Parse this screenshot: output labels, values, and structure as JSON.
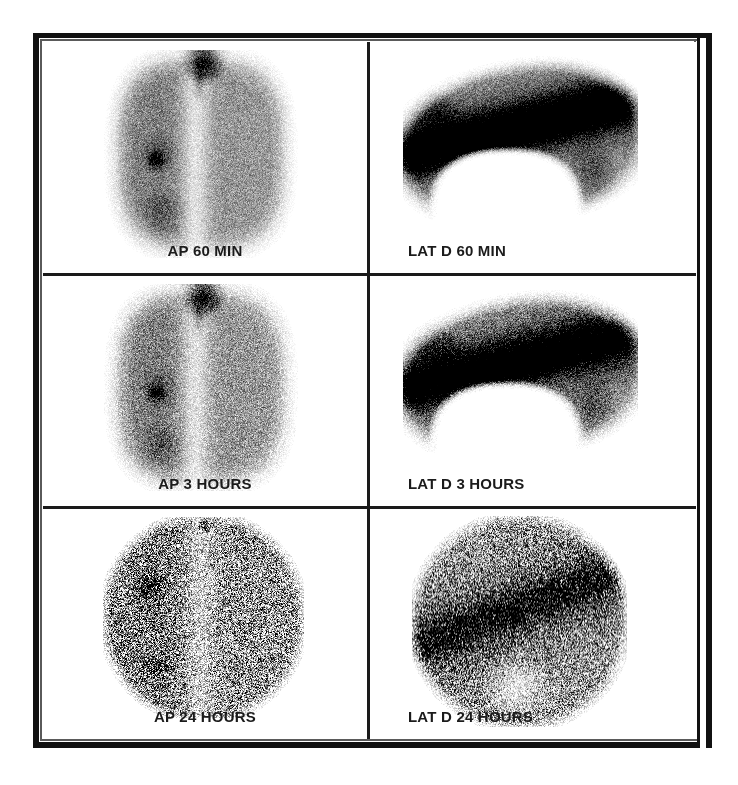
{
  "figure": {
    "type": "lymphoscintigraphy-panel-figure",
    "modality": "nuclear-medicine-scintigraphy",
    "grid": {
      "rows": 3,
      "columns": 2
    },
    "background_color": "#ffffff",
    "frame_color": "#111111",
    "label_color": "#1b1b1b"
  },
  "panels": [
    {
      "id": "ap-60-min",
      "label": "AP 60 MIN",
      "view": "AP",
      "timepoint": "60 MIN",
      "label_align": "center",
      "row": 1,
      "column": 1
    },
    {
      "id": "lat-d-60-min",
      "label": "LAT D 60 MIN",
      "view": "LAT D",
      "timepoint": "60 MIN",
      "label_align": "left",
      "row": 1,
      "column": 2
    },
    {
      "id": "ap-3-hours",
      "label": "AP 3 HOURS",
      "view": "AP",
      "timepoint": "3 HOURS",
      "label_align": "center",
      "row": 2,
      "column": 1
    },
    {
      "id": "lat-d-3-hours",
      "label": "LAT D 3 HOURS",
      "view": "LAT D",
      "timepoint": "3 HOURS",
      "label_align": "left",
      "row": 2,
      "column": 2
    },
    {
      "id": "ap-24-hours",
      "label": "AP 24 HOURS",
      "view": "AP",
      "timepoint": "24 HOURS",
      "label_align": "center",
      "row": 3,
      "column": 1
    },
    {
      "id": "lat-d-24-hours",
      "label": "LAT D 24 HOURS",
      "view": "LAT D",
      "timepoint": "24 HOURS",
      "label_align": "left",
      "row": 3,
      "column": 2
    }
  ]
}
